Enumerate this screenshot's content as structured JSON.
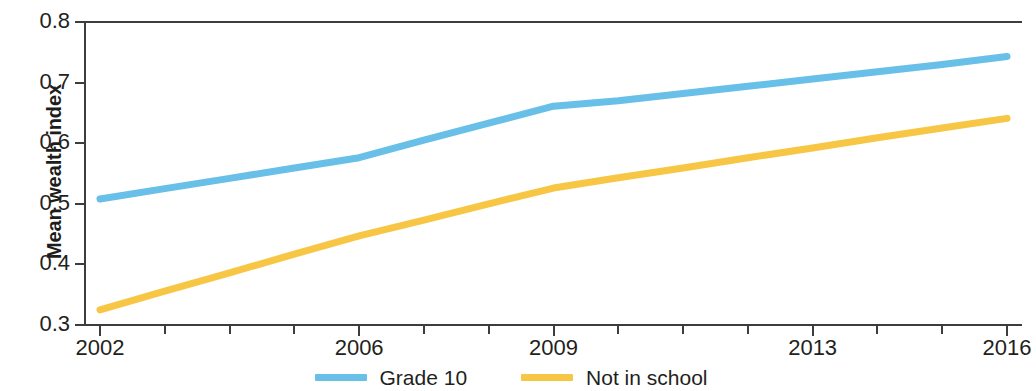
{
  "chart_data": {
    "type": "line",
    "title": "",
    "subtitle": "",
    "xlabel": "",
    "ylabel": "Mean wealth index",
    "x": [
      2002,
      2003,
      2004,
      2005,
      2006,
      2007,
      2008,
      2009,
      2010,
      2011,
      2012,
      2013,
      2014,
      2015,
      2016
    ],
    "xlim": [
      2002,
      2016
    ],
    "ylim": [
      0.3,
      0.8
    ],
    "x_tick_labels": [
      "2002",
      "2006",
      "2009",
      "2013",
      "2016"
    ],
    "x_tick_values": [
      2002,
      2006,
      2009,
      2013,
      2016
    ],
    "x_minor_ticks": [
      2003,
      2004,
      2005,
      2007,
      2008,
      2010,
      2011,
      2012,
      2014,
      2015
    ],
    "y_tick_labels": [
      "0.3",
      "0.4",
      "0.5",
      "0.6",
      "0.7",
      "0.8"
    ],
    "y_tick_values": [
      0.3,
      0.4,
      0.5,
      0.6,
      0.7,
      0.8
    ],
    "grid": false,
    "legend_position": "bottom-center",
    "series": [
      {
        "name": "Grade 10",
        "color": "#68bfe8",
        "values": [
          0.508,
          0.525,
          0.542,
          0.559,
          0.576,
          0.605,
          0.633,
          0.661,
          0.67,
          0.682,
          0.694,
          0.706,
          0.718,
          0.73,
          0.743
        ]
      },
      {
        "name": "Not in school",
        "color": "#f7c644",
        "values": [
          0.325,
          0.356,
          0.386,
          0.417,
          0.447,
          0.473,
          0.5,
          0.526,
          0.543,
          0.559,
          0.576,
          0.592,
          0.609,
          0.625,
          0.641
        ]
      }
    ]
  },
  "axes": {
    "y_title": "Mean wealth index",
    "y_ticks": [
      {
        "label": "0.8",
        "value": 0.8
      },
      {
        "label": "0.7",
        "value": 0.7
      },
      {
        "label": "0.6",
        "value": 0.6
      },
      {
        "label": "0.5",
        "value": 0.5
      },
      {
        "label": "0.4",
        "value": 0.4
      },
      {
        "label": "0.3",
        "value": 0.3
      }
    ],
    "x_ticks": [
      {
        "label": "2002",
        "value": 2002
      },
      {
        "label": "2006",
        "value": 2006
      },
      {
        "label": "2009",
        "value": 2009
      },
      {
        "label": "2013",
        "value": 2013
      },
      {
        "label": "2016",
        "value": 2016
      }
    ],
    "axis_color": "#3d3d3d"
  },
  "legend": {
    "items": [
      {
        "label": "Grade 10",
        "color": "#68bfe8"
      },
      {
        "label": "Not in school",
        "color": "#f7c644"
      }
    ]
  }
}
